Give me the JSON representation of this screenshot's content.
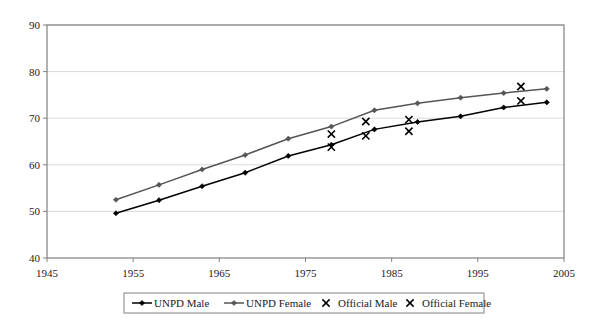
{
  "chart_data": {
    "type": "line",
    "title": "",
    "xlabel": "",
    "ylabel": "",
    "xlim": [
      1945,
      2005
    ],
    "ylim": [
      40,
      90
    ],
    "xticks": [
      1945,
      1955,
      1965,
      1975,
      1985,
      1995,
      2005
    ],
    "yticks": [
      40,
      50,
      60,
      70,
      80,
      90
    ],
    "grid": "horizontal",
    "legend_position": "bottom",
    "series": [
      {
        "name": "UNPD Male",
        "marker": "diamond",
        "color": "#000000",
        "style": "line-marker",
        "x": [
          1953,
          1958,
          1963,
          1968,
          1973,
          1978,
          1983,
          1988,
          1993,
          1998,
          2003
        ],
        "y": [
          49.6,
          52.4,
          55.4,
          58.3,
          61.9,
          64.3,
          67.6,
          69.2,
          70.4,
          72.3,
          73.4
        ]
      },
      {
        "name": "UNPD Female",
        "marker": "diamond",
        "color": "#555555",
        "style": "line-marker",
        "x": [
          1953,
          1958,
          1963,
          1968,
          1973,
          1978,
          1983,
          1988,
          1993,
          1998,
          2003
        ],
        "y": [
          52.5,
          55.7,
          59.0,
          62.1,
          65.6,
          68.2,
          71.7,
          73.2,
          74.4,
          75.4,
          76.3
        ]
      },
      {
        "name": "Official Male",
        "marker": "x",
        "color": "#000000",
        "style": "marker-only",
        "x": [
          1978,
          1982,
          1987,
          2000
        ],
        "y": [
          63.8,
          66.2,
          67.2,
          73.7
        ]
      },
      {
        "name": "Official Female",
        "marker": "x",
        "color": "#000000",
        "style": "marker-only",
        "x": [
          1978,
          1982,
          1987,
          2000
        ],
        "y": [
          66.6,
          69.3,
          69.7,
          76.8
        ]
      }
    ]
  },
  "axes": {
    "x_tick_labels": [
      "1945",
      "1955",
      "1965",
      "1975",
      "1985",
      "1995",
      "2005"
    ],
    "y_tick_labels": [
      "40",
      "50",
      "60",
      "70",
      "80",
      "90"
    ]
  },
  "legend": {
    "entries": [
      {
        "label": "UNPD Male",
        "symbol": "line-diamond",
        "color": "#000000"
      },
      {
        "label": "UNPD Female",
        "symbol": "line-diamond",
        "color": "#555555"
      },
      {
        "label": "Official Male",
        "symbol": "x",
        "color": "#000000"
      },
      {
        "label": "Official Female",
        "symbol": "x",
        "color": "#000000"
      }
    ]
  },
  "colors": {
    "plot_border": "#808080",
    "gridline": "#d9d9d9",
    "background": "#ffffff"
  }
}
